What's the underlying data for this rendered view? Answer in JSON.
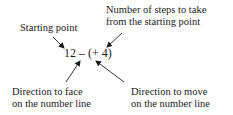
{
  "diagram": {
    "expression": "12 – (+ 4)",
    "labels": {
      "starting_point": "Starting point",
      "steps_line1": "Number of steps to take",
      "steps_line2": "from the starting point",
      "face_line1": "Direction to face",
      "face_line2": "on the number line",
      "move_line1": "Direction to move",
      "move_line2": "on the number line"
    },
    "arrows": [
      {
        "from": "Starting point",
        "to": "12"
      },
      {
        "from": "Number of steps to take from the starting point",
        "to": "4"
      },
      {
        "from": "Direction to face on the number line",
        "to": "–"
      },
      {
        "from": "Direction to move on the number line",
        "to": "+"
      }
    ]
  }
}
